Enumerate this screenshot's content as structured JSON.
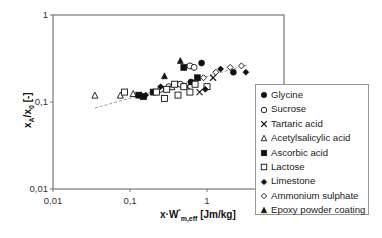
{
  "chart_data": {
    "type": "scatter",
    "title": "",
    "xlabel": "x·W*m,eff [Jm/kg]",
    "ylabel": "xA/x0 [-]",
    "xscale": "log",
    "yscale": "log",
    "xlim": [
      0.01,
      10
    ],
    "ylim": [
      0.01,
      1
    ],
    "x_ticks": [
      "0,01",
      "0,1",
      "1",
      "10"
    ],
    "y_ticks": [
      "1",
      "0,1",
      "0,01"
    ],
    "grid": false,
    "legend_position": "right",
    "series": [
      {
        "name": "Glycine",
        "marker": "filled-circle",
        "points": [
          [
            0.85,
            0.28
          ],
          [
            2.2,
            0.22
          ],
          [
            0.62,
            0.17
          ]
        ]
      },
      {
        "name": "Sucrose",
        "marker": "open-circle",
        "points": [
          [
            0.6,
            0.26
          ],
          [
            0.68,
            0.25
          ],
          [
            0.32,
            0.15
          ],
          [
            0.45,
            0.16
          ],
          [
            0.25,
            0.14
          ]
        ]
      },
      {
        "name": "Tartaric acid",
        "marker": "x",
        "points": [
          [
            1.2,
            0.19
          ],
          [
            0.8,
            0.13
          ],
          [
            0.55,
            0.15
          ]
        ]
      },
      {
        "name": "Acetylsalicylic acid",
        "marker": "open-triangle",
        "points": [
          [
            0.035,
            0.12
          ],
          [
            0.075,
            0.12
          ],
          [
            0.11,
            0.125
          ],
          [
            0.35,
            0.15
          ]
        ]
      },
      {
        "name": "Ascorbic acid",
        "marker": "filled-square",
        "points": [
          [
            0.13,
            0.12
          ],
          [
            0.15,
            0.115
          ],
          [
            0.5,
            0.25
          ],
          [
            0.75,
            0.19
          ],
          [
            0.2,
            0.13
          ]
        ]
      },
      {
        "name": "Lactose",
        "marker": "open-square",
        "points": [
          [
            0.085,
            0.13
          ],
          [
            0.22,
            0.13
          ],
          [
            0.3,
            0.14
          ],
          [
            0.38,
            0.16
          ],
          [
            0.42,
            0.12
          ],
          [
            0.5,
            0.15
          ],
          [
            0.7,
            0.16
          ],
          [
            1.0,
            0.15
          ],
          [
            0.6,
            0.13
          ],
          [
            0.28,
            0.11
          ]
        ]
      },
      {
        "name": "Limestone",
        "marker": "filled-diamond",
        "points": [
          [
            0.16,
            0.12
          ],
          [
            0.25,
            0.15
          ],
          [
            1.5,
            0.24
          ],
          [
            3.2,
            0.22
          ],
          [
            0.95,
            0.14
          ]
        ]
      },
      {
        "name": "Ammonium sulphate",
        "marker": "open-diamond",
        "points": [
          [
            1.3,
            0.22
          ],
          [
            2.0,
            0.25
          ],
          [
            2.8,
            0.26
          ],
          [
            0.9,
            0.19
          ]
        ]
      },
      {
        "name": "Epoxy powder coating",
        "marker": "filled-triangle",
        "points": [
          [
            0.45,
            0.3
          ],
          [
            0.28,
            0.2
          ],
          [
            0.14,
            0.12
          ]
        ]
      }
    ],
    "trendline": {
      "style": "dashed",
      "color": "#999999",
      "from": [
        0.035,
        0.085
      ],
      "to": [
        3.5,
        0.27
      ]
    }
  },
  "axes": {
    "xlabel_main": "x·W",
    "xlabel_sup": "*",
    "xlabel_sub": "m,eff",
    "xlabel_unit": " [Jm/kg]",
    "ylabel_main": "x",
    "ylabel_sub1": "A",
    "ylabel_mid": "/x",
    "ylabel_sub2": "0",
    "ylabel_unit": " [-]"
  },
  "legend": {
    "items": [
      {
        "label": "Glycine",
        "marker": "filled-circle"
      },
      {
        "label": "Sucrose",
        "marker": "open-circle"
      },
      {
        "label": "Tartaric acid",
        "marker": "x"
      },
      {
        "label": "Acetylsalicylic acid",
        "marker": "open-triangle"
      },
      {
        "label": "Ascorbic acid",
        "marker": "filled-square"
      },
      {
        "label": "Lactose",
        "marker": "open-square"
      },
      {
        "label": "Limestone",
        "marker": "filled-diamond"
      },
      {
        "label": "Ammonium sulphate",
        "marker": "open-diamond"
      },
      {
        "label": "Epoxy powder coating",
        "marker": "filled-triangle"
      }
    ]
  },
  "colors": {
    "axis": "#777777",
    "marker": "#111111",
    "trend": "#999999"
  }
}
